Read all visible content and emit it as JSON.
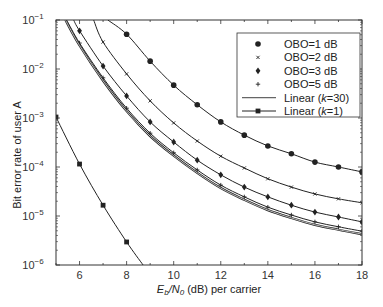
{
  "chart_data": {
    "type": "line",
    "title": "",
    "xlabel": {
      "pre": "E",
      "sub1": "b",
      "mid": "/N",
      "sub2": "0",
      "post": " (dB) per carrier"
    },
    "xlabel_text": "Eb/N0 (dB) per carrier",
    "ylabel": "Bit error rate of user A",
    "xlim": [
      5,
      18
    ],
    "ylim": [
      1e-06,
      0.1
    ],
    "yscale": "log",
    "x_ticks": [
      6,
      8,
      10,
      12,
      14,
      16,
      18
    ],
    "x_tick_labels": [
      "6",
      "8",
      "10",
      "12",
      "14",
      "16",
      "18"
    ],
    "y_ticks": [
      -1,
      -2,
      -3,
      -4,
      -5,
      -6
    ],
    "y_tick_labels": [
      {
        "base": "10",
        "exp": "−1"
      },
      {
        "base": "10",
        "exp": "−2"
      },
      {
        "base": "10",
        "exp": "−3"
      },
      {
        "base": "10",
        "exp": "−4"
      },
      {
        "base": "10",
        "exp": "−5"
      },
      {
        "base": "10",
        "exp": "−6"
      }
    ],
    "grid": false,
    "legend_position": "top-right",
    "series": [
      {
        "name": "OBO=1 dB",
        "marker": "circle",
        "x": [
          7.2,
          8,
          9,
          10,
          11,
          12,
          13,
          14,
          15,
          16,
          17,
          18
        ],
        "log10_y": [
          -1.0,
          -1.29,
          -1.84,
          -2.33,
          -2.73,
          -3.08,
          -3.35,
          -3.57,
          -3.73,
          -3.9,
          -4.0,
          -4.1
        ],
        "marker_x": [
          8,
          9,
          10,
          11,
          12,
          13,
          14,
          15,
          16,
          17,
          18
        ]
      },
      {
        "name": "OBO=2 dB",
        "marker": "x",
        "x": [
          6.6,
          7,
          8,
          9,
          10,
          11,
          12,
          13,
          14,
          15,
          16,
          17,
          18
        ],
        "log10_y": [
          -1.0,
          -1.45,
          -2.1,
          -2.65,
          -3.1,
          -3.47,
          -3.78,
          -4.02,
          -4.24,
          -4.41,
          -4.55,
          -4.65,
          -4.73
        ],
        "marker_x": [
          7,
          8,
          9,
          10,
          11,
          12,
          13,
          14,
          15,
          16,
          17,
          18
        ]
      },
      {
        "name": "OBO=3 dB",
        "marker": "diamond",
        "x": [
          5.75,
          6,
          7,
          8,
          9,
          10,
          11,
          12,
          13,
          14,
          15,
          16,
          17,
          18
        ],
        "log10_y": [
          -1.0,
          -1.22,
          -1.94,
          -2.55,
          -3.08,
          -3.49,
          -3.86,
          -4.16,
          -4.41,
          -4.61,
          -4.78,
          -4.92,
          -5.02,
          -5.12
        ],
        "marker_x": [
          6,
          7,
          8,
          9,
          10,
          11,
          12,
          13,
          14,
          15,
          16,
          17,
          18
        ]
      },
      {
        "name": "OBO=5 dB",
        "marker": "plus",
        "x": [
          5.45,
          6,
          7,
          8,
          9,
          10,
          11,
          12,
          13,
          14,
          15,
          16,
          17,
          18
        ],
        "log10_y": [
          -1.0,
          -1.47,
          -2.18,
          -2.8,
          -3.31,
          -3.71,
          -4.06,
          -4.37,
          -4.61,
          -4.82,
          -4.98,
          -5.12,
          -5.22,
          -5.31
        ],
        "marker_x": [
          6,
          7,
          8,
          9,
          10,
          11,
          12,
          13,
          14,
          15,
          16,
          17,
          18
        ]
      },
      {
        "name": "Linear (k=30)",
        "marker": "none",
        "x": [
          5.4,
          6,
          7,
          8,
          9,
          10,
          11,
          12,
          13,
          14,
          15,
          16,
          17,
          18
        ],
        "log10_y": [
          -1.0,
          -1.52,
          -2.24,
          -2.86,
          -3.37,
          -3.77,
          -4.12,
          -4.43,
          -4.67,
          -4.88,
          -5.04,
          -5.18,
          -5.28,
          -5.37
        ],
        "marker_x": []
      },
      {
        "name": "Linear (k=1)",
        "marker": "square",
        "x": [
          5,
          6,
          7,
          8,
          8.7
        ],
        "log10_y": [
          -2.98,
          -3.94,
          -4.78,
          -5.53,
          -6.0
        ],
        "marker_x": [
          5,
          6,
          7,
          8
        ]
      }
    ],
    "legend": [
      {
        "label": "OBO=1 dB",
        "marker": "circle"
      },
      {
        "label": "OBO=2 dB",
        "marker": "x"
      },
      {
        "label": "OBO=3 dB",
        "marker": "diamond"
      },
      {
        "label": "OBO=5 dB",
        "marker": "plus"
      },
      {
        "label_pre": "Linear (",
        "label_k": "k",
        "label_post": "=30)",
        "label": "Linear (k=30)",
        "marker": "line"
      },
      {
        "label_pre": "Linear (",
        "label_k": "k",
        "label_post": "=1)",
        "label": "Linear (k=1)",
        "marker": "line-square"
      }
    ],
    "colors": {
      "line": "#222222",
      "axis": "#333333"
    }
  }
}
